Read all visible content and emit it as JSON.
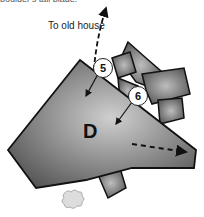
{
  "caption": "boulder's tall blade.",
  "direction_label": "To old house",
  "markers": [
    {
      "id": "5",
      "label": "5"
    },
    {
      "id": "6",
      "label": "6"
    }
  ],
  "area": {
    "label": "D"
  },
  "colors": {
    "stone_dark": "#4a4a4a",
    "stone_light": "#c8c8c8",
    "outline": "#111111"
  }
}
